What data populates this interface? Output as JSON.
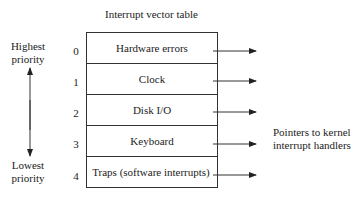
{
  "title": "Interrupt vector table",
  "priority": {
    "highest": [
      "Highest",
      "priority"
    ],
    "lowest": [
      "Lowest",
      "priority"
    ]
  },
  "rows": [
    {
      "index": "0",
      "label": "Hardware errors"
    },
    {
      "index": "1",
      "label": "Clock"
    },
    {
      "index": "2",
      "label": "Disk I/O"
    },
    {
      "index": "3",
      "label": "Keyboard"
    },
    {
      "index": "4",
      "label": "Traps (software interrupts)"
    }
  ],
  "pointers_label": [
    "Pointers to kernel",
    "interrupt handlers"
  ]
}
